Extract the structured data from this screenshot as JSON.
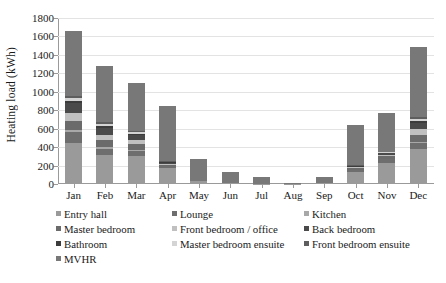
{
  "chart_data": {
    "type": "bar",
    "stacked": true,
    "title": "",
    "xlabel": "",
    "ylabel": "Heating load (kWh)",
    "ylim": [
      0,
      1800
    ],
    "ytick_labels": [
      "1800",
      "1600",
      "1400",
      "1200",
      "1000",
      "800",
      "600",
      "400",
      "200",
      "0"
    ],
    "ytick_values": [
      1800,
      1600,
      1400,
      1200,
      1000,
      800,
      600,
      400,
      200,
      0
    ],
    "grid": true,
    "legend_position": "bottom",
    "categories": [
      "Jan",
      "Feb",
      "Mar",
      "Apr",
      "May",
      "Jun",
      "Jul",
      "Aug",
      "Sep",
      "Oct",
      "Nov",
      "Dec"
    ],
    "series": [
      {
        "name": "Entry hall",
        "color": "#9a9a9a",
        "values": [
          450,
          310,
          305,
          170,
          35,
          10,
          5,
          2,
          10,
          130,
          230,
          380
        ]
      },
      {
        "name": "Lounge",
        "color": "#6e6e6e",
        "values": [
          115,
          75,
          55,
          20,
          0,
          0,
          0,
          0,
          0,
          20,
          40,
          65
        ]
      },
      {
        "name": "Kitchen",
        "color": "#a8a8a8",
        "values": [
          20,
          15,
          10,
          5,
          0,
          0,
          0,
          0,
          0,
          5,
          5,
          15
        ]
      },
      {
        "name": "Master bedroom",
        "color": "#6b6b6b",
        "values": [
          95,
          75,
          60,
          15,
          0,
          0,
          0,
          0,
          0,
          15,
          25,
          70
        ]
      },
      {
        "name": "Front bedroom / office",
        "color": "#c0c0c0",
        "values": [
          90,
          60,
          45,
          10,
          0,
          0,
          0,
          0,
          0,
          10,
          20,
          65
        ]
      },
      {
        "name": "Back bedroom",
        "color": "#4a4a4a",
        "values": [
          105,
          75,
          55,
          10,
          0,
          0,
          0,
          0,
          0,
          10,
          15,
          70
        ]
      },
      {
        "name": "Bathroom",
        "color": "#3c3c3c",
        "values": [
          25,
          20,
          15,
          5,
          0,
          0,
          0,
          0,
          0,
          5,
          5,
          20
        ]
      },
      {
        "name": "Master bedroom ensuite",
        "color": "#d4d4d4",
        "values": [
          30,
          25,
          20,
          5,
          0,
          0,
          0,
          0,
          0,
          5,
          5,
          25
        ]
      },
      {
        "name": "Front bedroom ensuite",
        "color": "#5e5e5e",
        "values": [
          25,
          20,
          15,
          5,
          0,
          0,
          0,
          0,
          0,
          5,
          5,
          20
        ]
      },
      {
        "name": "MVHR",
        "color": "#787878",
        "values": [
          705,
          605,
          520,
          600,
          235,
          120,
          67,
          8,
          70,
          435,
          420,
          760
        ]
      }
    ],
    "totals": [
      1660,
      1280,
      1100,
      845,
      270,
      130,
      72,
      10,
      80,
      640,
      770,
      1480
    ]
  },
  "legend": {
    "entries": [
      {
        "label": "Entry hall"
      },
      {
        "label": "Lounge"
      },
      {
        "label": "Kitchen"
      },
      {
        "label": "Master bedroom"
      },
      {
        "label": "Front bedroom / office"
      },
      {
        "label": "Back bedroom"
      },
      {
        "label": "Bathroom"
      },
      {
        "label": "Master bedroom ensuite"
      },
      {
        "label": "Front bedroom ensuite"
      },
      {
        "label": "MVHR"
      }
    ]
  }
}
